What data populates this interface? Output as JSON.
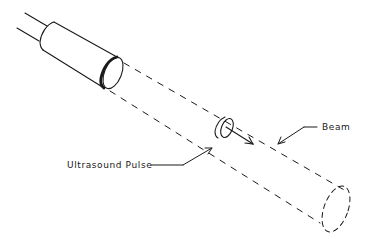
{
  "diagram": {
    "type": "schematic",
    "labels": {
      "beam": "Beam",
      "pulse": "Ultrasound Pulse"
    },
    "components": [
      {
        "id": "cable",
        "description": "two parallel cable lines entering transducer"
      },
      {
        "id": "transducer",
        "description": "cylindrical probe with thick-rimmed front face"
      },
      {
        "id": "beam",
        "description": "dashed diverging cylinder extending from transducer face"
      },
      {
        "id": "pulse",
        "description": "small disk within the beam with direction arrow"
      },
      {
        "id": "beam-end",
        "description": "dashed ellipse at far end of beam"
      }
    ],
    "colors": {
      "line": "#1a1a1a",
      "background": "#ffffff"
    }
  }
}
